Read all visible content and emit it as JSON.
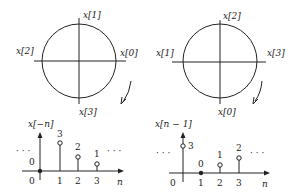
{
  "left_panel": {
    "circle_labels": {
      "top": "x[1]",
      "left": "x[2]",
      "right": "x[0]",
      "bottom": "x[3]"
    },
    "plot": {
      "ylabel": "x[−n]",
      "xlabel": "n",
      "ellipsis_left": "· · ·",
      "ellipsis_right": "· · ·",
      "ticks": [
        "0",
        "1",
        "2",
        "3"
      ],
      "values": [
        {
          "n": "0",
          "label": "0",
          "filled": true
        },
        {
          "n": "1",
          "label": "3",
          "filled": false
        },
        {
          "n": "2",
          "label": "2",
          "filled": false
        },
        {
          "n": "3",
          "label": "1",
          "filled": false
        }
      ]
    }
  },
  "right_panel": {
    "circle_labels": {
      "top": "x[2]",
      "left": "x[1]",
      "right": "x[3]",
      "bottom": "x[0]"
    },
    "plot": {
      "ylabel": "x[n − 1]",
      "xlabel": "n",
      "ellipsis_left": "· · ·",
      "ellipsis_right": "· · ·",
      "ticks": [
        "0",
        "1",
        "2",
        "3"
      ],
      "values": [
        {
          "n": "0",
          "label": "3",
          "filled": false
        },
        {
          "n": "1",
          "label": "0",
          "filled": true
        },
        {
          "n": "2",
          "label": "1",
          "filled": false
        },
        {
          "n": "3",
          "label": "2",
          "filled": false
        }
      ]
    }
  }
}
